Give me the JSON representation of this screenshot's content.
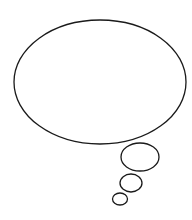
{
  "illustration": {
    "type": "thought-bubble",
    "background": "#ffffff",
    "stroke_color": "#1a1a1a",
    "stroke_width": 1.3,
    "main_bubble": {
      "cx": 100,
      "cy": 82,
      "rx": 86,
      "ry": 62
    },
    "trail_bubbles": [
      {
        "cx": 140,
        "cy": 157,
        "rx": 19,
        "ry": 14
      },
      {
        "cx": 131,
        "cy": 183,
        "rx": 11,
        "ry": 9
      },
      {
        "cx": 120,
        "cy": 199,
        "rx": 7.5,
        "ry": 6
      }
    ]
  }
}
